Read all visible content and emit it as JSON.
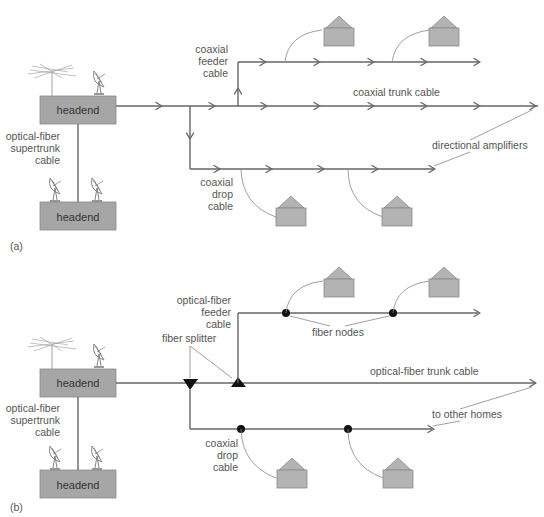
{
  "panel_a": {
    "label": "(a)",
    "headend_top": "headend",
    "headend_bottom": "headend",
    "supertrunk": [
      "optical-fiber",
      "supertrunk",
      "cable"
    ],
    "feeder": [
      "coaxial",
      "feeder",
      "cable"
    ],
    "trunk": "coaxial trunk cable",
    "drop": [
      "coaxial",
      "drop",
      "cable"
    ],
    "amplifiers": "directional amplifiers"
  },
  "panel_b": {
    "label": "(b)",
    "headend_top": "headend",
    "headend_bottom": "headend",
    "supertrunk": [
      "optical-fiber",
      "supertrunk",
      "cable"
    ],
    "feeder": [
      "optical-fiber",
      "feeder",
      "cable"
    ],
    "splitter": "fiber splitter",
    "nodes": "fiber nodes",
    "trunk": "optical-fiber trunk cable",
    "drop": [
      "coaxial",
      "drop",
      "cable"
    ],
    "other_homes": "to other homes"
  },
  "icons": {
    "antenna": "yagi-antenna-icon",
    "dish": "satellite-dish-icon",
    "house": "house-icon",
    "amplifier": "arrowhead-icon",
    "fiber_node": "black-dot-icon",
    "splitter": "black-triangle-icon"
  },
  "colors": {
    "line": "#666666",
    "box": "#a6a6a6",
    "house": "#b3b3b3",
    "node": "#111111",
    "text": "#555555"
  }
}
